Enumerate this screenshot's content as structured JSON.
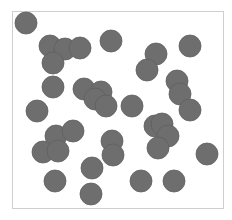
{
  "figure": {
    "frame": {
      "x": 12,
      "y": 11,
      "width": 212,
      "height": 198,
      "border_color": "#cfcfcf"
    },
    "disc_color": "#6e6e6e",
    "disc_stroke": "#5f5f5f",
    "disc_radius": 11,
    "discs": [
      {
        "cx": 26,
        "cy": 23
      },
      {
        "cx": 50,
        "cy": 46
      },
      {
        "cx": 65,
        "cy": 49
      },
      {
        "cx": 80,
        "cy": 48
      },
      {
        "cx": 53,
        "cy": 63
      },
      {
        "cx": 111,
        "cy": 41
      },
      {
        "cx": 156,
        "cy": 54
      },
      {
        "cx": 190,
        "cy": 46
      },
      {
        "cx": 147,
        "cy": 70
      },
      {
        "cx": 53,
        "cy": 87
      },
      {
        "cx": 84,
        "cy": 89
      },
      {
        "cx": 101,
        "cy": 92
      },
      {
        "cx": 95,
        "cy": 99
      },
      {
        "cx": 106,
        "cy": 106
      },
      {
        "cx": 132,
        "cy": 106
      },
      {
        "cx": 177,
        "cy": 81
      },
      {
        "cx": 180,
        "cy": 94
      },
      {
        "cx": 190,
        "cy": 110
      },
      {
        "cx": 37,
        "cy": 111
      },
      {
        "cx": 56,
        "cy": 136
      },
      {
        "cx": 73,
        "cy": 131
      },
      {
        "cx": 43,
        "cy": 152
      },
      {
        "cx": 58,
        "cy": 151
      },
      {
        "cx": 112,
        "cy": 141
      },
      {
        "cx": 113,
        "cy": 155
      },
      {
        "cx": 155,
        "cy": 126
      },
      {
        "cx": 162,
        "cy": 124
      },
      {
        "cx": 168,
        "cy": 136
      },
      {
        "cx": 158,
        "cy": 148
      },
      {
        "cx": 207,
        "cy": 154
      },
      {
        "cx": 92,
        "cy": 168
      },
      {
        "cx": 55,
        "cy": 181
      },
      {
        "cx": 91,
        "cy": 194
      },
      {
        "cx": 141,
        "cy": 181
      },
      {
        "cx": 174,
        "cy": 181
      }
    ]
  }
}
